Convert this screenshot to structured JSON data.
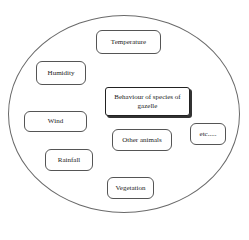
{
  "diagram": {
    "type": "factors-in-ellipse",
    "center": {
      "label": "Behaviour of species of gazelle"
    },
    "nodes": [
      {
        "id": "temperature",
        "label": "Temperature"
      },
      {
        "id": "humidity",
        "label": "Humidity"
      },
      {
        "id": "wind",
        "label": "Wind"
      },
      {
        "id": "other-animals",
        "label": "Other animals"
      },
      {
        "id": "etc",
        "label": "etc....."
      },
      {
        "id": "rainfall",
        "label": "Rainfall"
      },
      {
        "id": "vegetation",
        "label": "Vegetation"
      }
    ],
    "colors": {
      "border": "#555555",
      "background": "#ffffff",
      "text": "#222222"
    }
  }
}
